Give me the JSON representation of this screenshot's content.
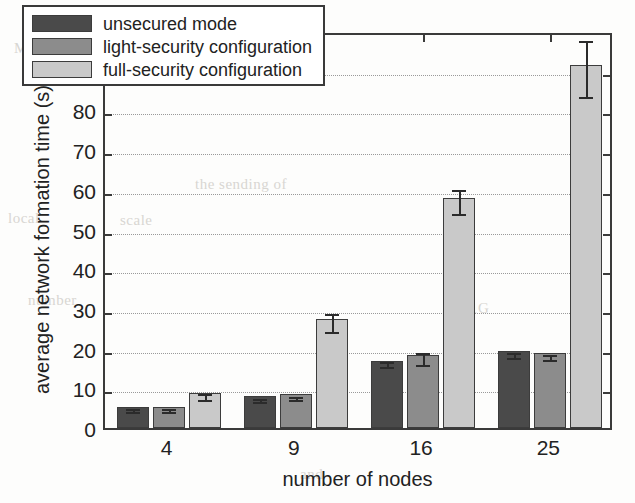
{
  "chart_data": {
    "type": "bar",
    "title": "",
    "xlabel": "number of nodes",
    "ylabel": "average network formation time (s)",
    "categories": [
      "4",
      "9",
      "16",
      "25"
    ],
    "ylim": [
      0,
      100
    ],
    "ytick_labels": [
      "0",
      "10",
      "20",
      "30",
      "40",
      "50",
      "60",
      "70",
      "80",
      "90",
      "100"
    ],
    "ytick_values": [
      0,
      10,
      20,
      30,
      40,
      50,
      60,
      70,
      80,
      90,
      100
    ],
    "grid": "horizontal-dotted",
    "legend_position": "top-left-inside",
    "series": [
      {
        "name": "unsecured mode",
        "color": "#4a4a4a",
        "values": [
          5.4,
          8.0,
          17.0,
          19.3
        ],
        "errors": [
          0.3,
          0.4,
          0.7,
          0.6
        ]
      },
      {
        "name": "light-security configuration",
        "color": "#8c8c8c",
        "values": [
          5.4,
          8.5,
          18.3,
          18.8
        ],
        "errors": [
          0.3,
          0.4,
          1.5,
          0.6
        ]
      },
      {
        "name": "full-security configuration",
        "color": "#c9c9c9",
        "values": [
          8.8,
          27.5,
          58.0,
          91.5
        ],
        "errors": [
          0.8,
          2.2,
          3.0,
          7.0
        ]
      }
    ]
  },
  "legend": {
    "items": [
      {
        "label": "unsecured mode",
        "color": "#4a4a4a"
      },
      {
        "label": "light-security configuration",
        "color": "#8c8c8c"
      },
      {
        "label": "full-security configuration",
        "color": "#c9c9c9"
      }
    ]
  },
  "background_text": [
    {
      "text": "MAC",
      "x": 14,
      "y": 40
    },
    {
      "text": "with",
      "x": 150,
      "y": 18
    },
    {
      "text": "the  sending  of",
      "x": 195,
      "y": 176
    },
    {
      "text": "local",
      "x": 8,
      "y": 210
    },
    {
      "text": "scale",
      "x": 120,
      "y": 212
    },
    {
      "text": "number",
      "x": 28,
      "y": 292
    },
    {
      "text": "1G",
      "x": 470,
      "y": 300
    },
    {
      "text": "and",
      "x": 300,
      "y": 466
    }
  ]
}
